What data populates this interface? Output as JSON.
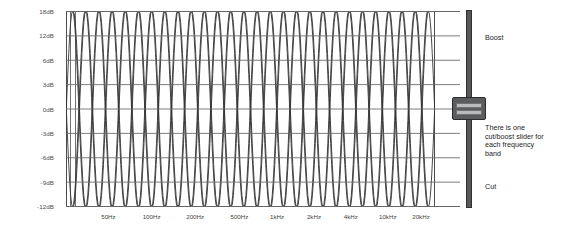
{
  "chart_data": {
    "type": "line",
    "title": "",
    "xlabel": "",
    "ylabel": "",
    "grid": true,
    "legend": "none",
    "ylim": [
      -12,
      18
    ],
    "y_ticks": [
      {
        "label": "18dB",
        "value": 18
      },
      {
        "label": "12dB",
        "value": 12
      },
      {
        "label": "6dB",
        "value": 6
      },
      {
        "label": "3dB",
        "value": 3
      },
      {
        "label": "0dB",
        "value": 0
      },
      {
        "label": "-3dB",
        "value": -3
      },
      {
        "label": "-6dB",
        "value": -6
      },
      {
        "label": "-9dB",
        "value": -9
      },
      {
        "label": "-12dB",
        "value": -12
      }
    ],
    "x_ticks": [
      {
        "label": "50Hz",
        "pos": 0.115
      },
      {
        "label": "100Hz",
        "pos": 0.232
      },
      {
        "label": "200Hz",
        "pos": 0.35
      },
      {
        "label": "500Hz",
        "pos": 0.47
      },
      {
        "label": "1kHz",
        "pos": 0.572
      },
      {
        "label": "2kHz",
        "pos": 0.672
      },
      {
        "label": "4kHz",
        "pos": 0.772
      },
      {
        "label": "10kHz",
        "pos": 0.872
      },
      {
        "label": "20kHz",
        "pos": 0.962
      }
    ],
    "band_count": 28,
    "series": [
      {
        "name": "band-response-curves",
        "description": "overlapping narrow bell-shaped cut/boost band curves spanning full +18dB to -12dB range"
      }
    ],
    "curve_color": "#333333",
    "grid_color": "#666666",
    "frame_color": "#4d4d4d"
  },
  "slider": {
    "name": "cut-boost-slider",
    "position_label": "0dB",
    "track_color": "#555759",
    "handle_color": "#5a5c5e",
    "handle_band_color": "#b9bbbd"
  },
  "annotations": {
    "boost": "Boost",
    "cut": "Cut",
    "description": "There is one\ncut/boost slider for\neach frequency\nband"
  }
}
